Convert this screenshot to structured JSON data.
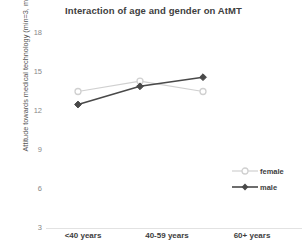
{
  "chart_data": {
    "type": "line",
    "title": "Interaction of age and gender on AtMT",
    "xlabel": "",
    "ylabel": "Attitude towards medical technology  (min=3, max=18)",
    "categories": [
      "<40 years",
      "40-59 years",
      "60+ years"
    ],
    "yticks": [
      18,
      15,
      12,
      9,
      6,
      3
    ],
    "ylim": [
      3,
      18
    ],
    "grid": false,
    "legend_position": "right",
    "series": [
      {
        "name": "female",
        "values": [
          13.5,
          14.3,
          13.5
        ],
        "color": "#d0d0d0",
        "marker": "open-circle"
      },
      {
        "name": "male",
        "values": [
          12.5,
          13.9,
          14.6
        ],
        "color": "#494949",
        "marker": "filled-diamond"
      }
    ]
  },
  "legend": {
    "items": [
      {
        "label": "female"
      },
      {
        "label": "male"
      }
    ]
  }
}
